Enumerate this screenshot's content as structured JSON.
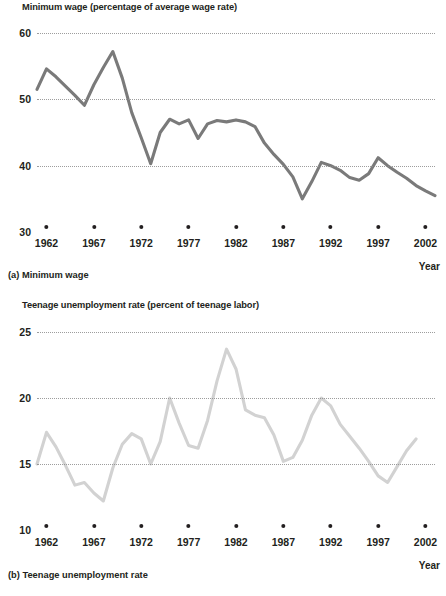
{
  "figure": {
    "year_axis_label": "Year"
  },
  "panel_a": {
    "axis_title": "Minimum wage (percentage of average wage rate)",
    "caption": "(a) Minimum wage",
    "year_label": "Year",
    "yticks": [
      "60",
      "50",
      "40",
      "30"
    ],
    "xticks": [
      "1962",
      "1967",
      "1972",
      "1977",
      "1982",
      "1987",
      "1992",
      "1997",
      "2002"
    ]
  },
  "panel_b": {
    "axis_title": "Teenage unemployment rate (percent of teenage labor)",
    "caption": "(b) Teenage unemployment rate",
    "year_label": "Year",
    "yticks": [
      "25",
      "20",
      "15",
      "10"
    ],
    "xticks": [
      "1962",
      "1967",
      "1972",
      "1977",
      "1982",
      "1987",
      "1992",
      "1997",
      "2002"
    ]
  },
  "chart_data": [
    {
      "type": "line",
      "id": "minimum-wage",
      "title": "Minimum wage (percentage of average wage rate)",
      "caption": "(a) Minimum wage",
      "xlabel": "Year",
      "ylabel": "Minimum wage (percentage of average wage rate)",
      "ylim": [
        30,
        60
      ],
      "xlim": [
        1961,
        2003
      ],
      "yticks": [
        30,
        40,
        50,
        60
      ],
      "xticks": [
        1962,
        1967,
        1972,
        1977,
        1982,
        1987,
        1992,
        1997,
        2002
      ],
      "grid": "horizontal-dotted",
      "legend": "none",
      "line_color": "#7a7a7a",
      "series": [
        {
          "name": "Minimum wage as percent of average wage",
          "x": [
            1961,
            1962,
            1963,
            1964,
            1965,
            1966,
            1967,
            1968,
            1969,
            1970,
            1971,
            1972,
            1973,
            1974,
            1975,
            1976,
            1977,
            1978,
            1979,
            1980,
            1981,
            1982,
            1983,
            1984,
            1985,
            1986,
            1987,
            1988,
            1989,
            1990,
            1991,
            1992,
            1993,
            1994,
            1995,
            1996,
            1997,
            1998,
            1999,
            2000,
            2001,
            2002,
            2003
          ],
          "values": [
            51.5,
            54.6,
            53.4,
            52.0,
            50.6,
            49.1,
            52.2,
            54.8,
            57.2,
            53.2,
            48.0,
            44.2,
            40.3,
            45.0,
            47.0,
            46.3,
            46.9,
            44.1,
            46.3,
            46.8,
            46.6,
            46.9,
            46.6,
            45.9,
            43.4,
            41.7,
            40.2,
            38.3,
            35.0,
            37.6,
            40.5,
            40.0,
            39.3,
            38.2,
            37.8,
            38.8,
            41.2,
            40.0,
            39.0,
            38.1,
            37.0,
            36.2,
            35.5
          ]
        }
      ]
    },
    {
      "type": "line",
      "id": "teenage-unemployment",
      "title": "Teenage unemployment rate (percent of teenage labor)",
      "caption": "(b) Teenage unemployment rate",
      "xlabel": "Year",
      "ylabel": "Teenage unemployment rate (percent of teenage labor)",
      "ylim": [
        10,
        25
      ],
      "xlim": [
        1961,
        2003
      ],
      "yticks": [
        10,
        15,
        20,
        25
      ],
      "xticks": [
        1962,
        1967,
        1972,
        1977,
        1982,
        1987,
        1992,
        1997,
        2002
      ],
      "grid": "horizontal-dotted",
      "legend": "none",
      "line_color": "#d2d2d2",
      "series": [
        {
          "name": "Teenage unemployment rate",
          "x": [
            1961,
            1962,
            1963,
            1964,
            1965,
            1966,
            1967,
            1968,
            1969,
            1970,
            1971,
            1972,
            1973,
            1974,
            1975,
            1976,
            1977,
            1978,
            1979,
            1980,
            1981,
            1982,
            1983,
            1984,
            1985,
            1986,
            1987,
            1988,
            1989,
            1990,
            1991,
            1992,
            1993,
            1994,
            1995,
            1996,
            1997,
            1998,
            1999,
            2000,
            2001,
            2002,
            2003
          ],
          "values": [
            15.0,
            17.4,
            16.3,
            14.9,
            13.4,
            13.6,
            12.8,
            12.2,
            14.7,
            16.5,
            17.3,
            16.9,
            15.0,
            16.7,
            20.0,
            18.1,
            16.4,
            16.2,
            18.3,
            21.3,
            23.7,
            22.2,
            19.1,
            18.7,
            18.5,
            17.2,
            15.2,
            15.5,
            16.8,
            18.7,
            20.0,
            19.4,
            18.0,
            17.1,
            16.2,
            15.2,
            14.1,
            13.6,
            14.8,
            16.0,
            16.9
          ]
        }
      ]
    }
  ]
}
